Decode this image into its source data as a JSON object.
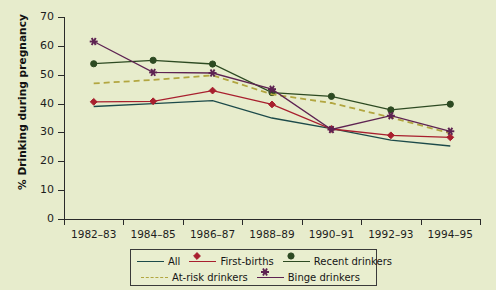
{
  "chart_data": {
    "type": "line",
    "title": "",
    "xlabel": "",
    "ylabel": "% Drinking during pregnancy",
    "categories": [
      "1982–83",
      "1984–85",
      "1986–87",
      "1988–89",
      "1990–91",
      "1992–93",
      "1994–95"
    ],
    "ylim": [
      0,
      70
    ],
    "yticks": [
      0,
      10,
      20,
      30,
      40,
      50,
      60,
      70
    ],
    "grid": false,
    "legend_position": "bottom",
    "series": [
      {
        "name": "All",
        "color": "#1c4a4a",
        "marker": "none",
        "dash": false,
        "values": [
          39.0,
          40.0,
          41.0,
          35.0,
          31.3,
          27.3,
          25.3
        ]
      },
      {
        "name": "First-births",
        "color": "#a81f2e",
        "marker": "diamond",
        "dash": false,
        "values": [
          40.6,
          40.8,
          44.5,
          39.7,
          31.2,
          29.0,
          28.3
        ]
      },
      {
        "name": "Recent drinkers",
        "color": "#2d4a22",
        "marker": "circle",
        "dash": false,
        "values": [
          53.8,
          55.0,
          53.7,
          43.8,
          42.5,
          37.8,
          39.8
        ]
      },
      {
        "name": "At-risk drinkers",
        "color": "#b2a640",
        "marker": "none",
        "dash": true,
        "values": [
          47.0,
          48.2,
          49.8,
          43.2,
          40.2,
          35.2,
          29.7
        ]
      },
      {
        "name": "Binge drinkers",
        "color": "#5e2352",
        "marker": "star",
        "dash": false,
        "values": [
          61.5,
          50.8,
          50.6,
          45.0,
          31.0,
          35.8,
          30.4
        ]
      }
    ]
  },
  "axis": {
    "y_tick_labels": [
      "0",
      "10",
      "20",
      "30",
      "40",
      "50",
      "60",
      "70"
    ],
    "x_tick_labels": [
      "1982–83",
      "1984–85",
      "1986–87",
      "1988–89",
      "1990–91",
      "1992–93",
      "1994–95"
    ],
    "y_axis_title": "% Drinking during pregnancy"
  },
  "legend": {
    "row1": [
      {
        "label": "All",
        "icon": "line-swatch"
      },
      {
        "label": "First-births",
        "icon": "line-diamond-swatch"
      },
      {
        "label": "Recent drinkers",
        "icon": "line-circle-swatch"
      }
    ],
    "row2": [
      {
        "label": "At-risk drinkers",
        "icon": "dashed-line-swatch"
      },
      {
        "label": "Binge drinkers",
        "icon": "line-star-swatch"
      }
    ]
  },
  "colors": {
    "background": "#e7eccc",
    "axis": "#2a2a2a",
    "all": "#1c4a4a",
    "first_births": "#a81f2e",
    "recent_drinkers": "#2d4a22",
    "at_risk_drinkers": "#b2a640",
    "binge_drinkers": "#5e2352"
  }
}
